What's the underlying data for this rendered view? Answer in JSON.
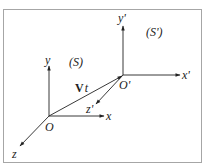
{
  "diagram": {
    "frame_color": "#a6a6a6",
    "line_color": "#222222",
    "frames": {
      "S": {
        "label": "(S)",
        "origin_label": "O",
        "axes": {
          "x": "x",
          "y": "y",
          "z": "z"
        }
      },
      "S_prime": {
        "label": "(S')",
        "origin_label": "O'",
        "axes": {
          "x": "x'",
          "y": "y'",
          "z": "z'"
        }
      }
    },
    "displacement": {
      "vector_symbol": "V",
      "time_symbol": "t"
    }
  }
}
